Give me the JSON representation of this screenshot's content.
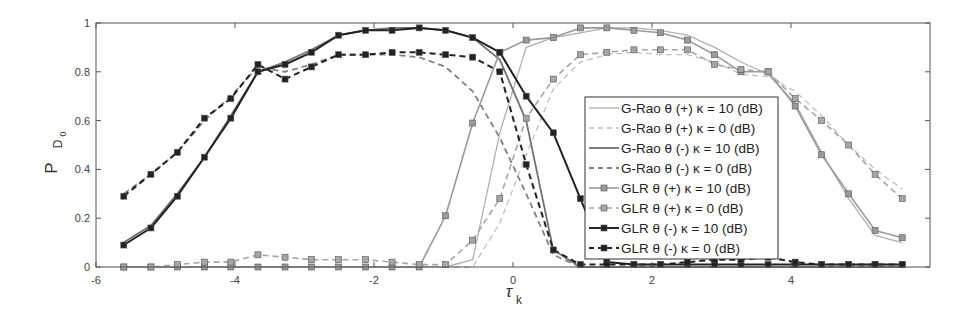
{
  "chart_data": {
    "type": "line",
    "title": "",
    "xlabel": "τ",
    "xlabel_sub": "k",
    "ylabel": "P",
    "ylabel_sub": "D",
    "ylabel_subsub": "0",
    "xlim": [
      -6,
      6
    ],
    "ylim": [
      0,
      1
    ],
    "xticks": [
      -6,
      -4,
      -2,
      0,
      2,
      4
    ],
    "xtick_labels": [
      "-6",
      "-4",
      "-2",
      "0",
      "2",
      "4"
    ],
    "yticks": [
      0,
      0.2,
      0.4,
      0.6,
      0.8,
      1
    ],
    "ytick_labels": [
      "0",
      "0.2",
      "0.4",
      "0.6",
      "0.8",
      "1"
    ],
    "grid": false,
    "legend_position": "center-right",
    "x": [
      -5.6,
      -5.21,
      -4.83,
      -4.44,
      -4.06,
      -3.67,
      -3.28,
      -2.9,
      -2.51,
      -2.12,
      -1.74,
      -1.35,
      -0.97,
      -0.58,
      -0.19,
      0.19,
      0.58,
      0.97,
      1.35,
      1.74,
      2.12,
      2.51,
      2.9,
      3.28,
      3.67,
      4.06,
      4.44,
      4.83,
      5.21,
      5.6
    ],
    "series": [
      {
        "name": "G-Rao θ (+) κ = 10 (dB)",
        "color": "#b0b0b0",
        "dash": "solid",
        "width": 1.3,
        "marker": "none",
        "values": [
          0,
          0,
          0,
          0,
          0,
          0,
          0,
          0,
          0,
          0,
          0,
          0,
          0,
          0.03,
          0.55,
          0.9,
          0.94,
          0.96,
          0.98,
          0.98,
          0.97,
          0.95,
          0.9,
          0.84,
          0.79,
          0.67,
          0.47,
          0.28,
          0.13,
          0.1
        ]
      },
      {
        "name": "G-Rao θ (+) κ = 0 (dB)",
        "color": "#c0c0c0",
        "dash": "dashed",
        "width": 1.3,
        "marker": "none",
        "values": [
          0,
          0,
          0,
          0,
          0,
          0,
          0,
          0,
          0,
          0,
          0,
          0,
          0,
          0,
          0.18,
          0.46,
          0.73,
          0.84,
          0.87,
          0.88,
          0.87,
          0.87,
          0.84,
          0.79,
          0.78,
          0.72,
          0.62,
          0.5,
          0.4,
          0.32
        ]
      },
      {
        "name": "G-Rao θ (-) κ = 10 (dB)",
        "color": "#707070",
        "dash": "solid",
        "width": 1.8,
        "marker": "none",
        "values": [
          0.1,
          0.17,
          0.3,
          0.45,
          0.62,
          0.8,
          0.84,
          0.89,
          0.95,
          0.97,
          0.98,
          0.98,
          0.97,
          0.94,
          0.85,
          0.6,
          0.07,
          0,
          0,
          0,
          0,
          0,
          0,
          0,
          0,
          0,
          0,
          0,
          0,
          0
        ]
      },
      {
        "name": "G-Rao θ (-) κ = 0 (dB)",
        "color": "#808080",
        "dash": "dashed",
        "width": 1.8,
        "marker": "none",
        "values": [
          0.3,
          0.38,
          0.47,
          0.6,
          0.7,
          0.82,
          0.8,
          0.83,
          0.87,
          0.87,
          0.87,
          0.86,
          0.82,
          0.72,
          0.53,
          0.3,
          0.05,
          0,
          0,
          0,
          0,
          0,
          0,
          0,
          0,
          0,
          0,
          0,
          0,
          0
        ]
      },
      {
        "name": "GLR θ (+) κ = 10 (dB)",
        "color": "#9a9a9a",
        "dash": "solid",
        "width": 1.6,
        "marker": "square",
        "values": [
          0,
          0,
          0,
          0,
          0,
          0,
          0,
          0,
          0,
          0,
          0,
          0,
          0.21,
          0.59,
          0.88,
          0.93,
          0.94,
          0.98,
          0.98,
          0.97,
          0.96,
          0.93,
          0.87,
          0.8,
          0.8,
          0.66,
          0.46,
          0.3,
          0.15,
          0.12
        ]
      },
      {
        "name": "GLR θ (+) κ = 0 (dB)",
        "color": "#a6a6a6",
        "dash": "dashed",
        "width": 1.6,
        "marker": "square",
        "values": [
          0,
          0,
          0.01,
          0.02,
          0.02,
          0.05,
          0.04,
          0.03,
          0.03,
          0.03,
          0.02,
          0.01,
          0.01,
          0.11,
          0.28,
          0.61,
          0.77,
          0.87,
          0.88,
          0.89,
          0.89,
          0.89,
          0.83,
          0.81,
          0.8,
          0.69,
          0.6,
          0.5,
          0.38,
          0.28
        ]
      },
      {
        "name": "GLR θ (-) κ = 10 (dB)",
        "color": "#222222",
        "dash": "solid",
        "width": 2.0,
        "marker": "square",
        "values": [
          0.09,
          0.16,
          0.29,
          0.45,
          0.61,
          0.8,
          0.83,
          0.88,
          0.95,
          0.97,
          0.97,
          0.98,
          0.97,
          0.94,
          0.88,
          0.7,
          0.55,
          0.28,
          0.02,
          0.01,
          0.01,
          0.01,
          0.01,
          0.01,
          0.01,
          0.01,
          0.01,
          0.01,
          0.01,
          0.01
        ]
      },
      {
        "name": "GLR θ (-) κ = 0 (dB)",
        "color": "#222222",
        "dash": "dashed",
        "width": 2.0,
        "marker": "square",
        "values": [
          0.29,
          0.38,
          0.47,
          0.61,
          0.69,
          0.83,
          0.77,
          0.82,
          0.87,
          0.87,
          0.88,
          0.88,
          0.87,
          0.86,
          0.8,
          0.42,
          0.07,
          0.01,
          0.01,
          0.01,
          0.01,
          0.02,
          0.03,
          0.03,
          0.04,
          0.02,
          0.01,
          0.01,
          0.01,
          0.01
        ]
      }
    ]
  }
}
